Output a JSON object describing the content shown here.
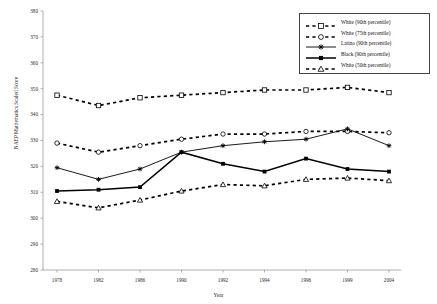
{
  "chart_data": {
    "type": "line",
    "title": "",
    "xlabel": "Year",
    "ylabel": "NAEP Mathematics Scaled Score",
    "x": [
      1978,
      1982,
      1986,
      1990,
      1992,
      1994,
      1996,
      1999,
      2004
    ],
    "xticklabels": [
      "1978",
      "1982",
      "1986",
      "1990",
      "1992",
      "1994",
      "1996",
      "1999",
      "2004"
    ],
    "yticks": [
      280,
      290,
      300,
      310,
      320,
      330,
      340,
      350,
      360,
      370,
      380
    ],
    "yticklabels": [
      "280",
      "290",
      "300",
      "310",
      "320",
      "330",
      "340",
      "350",
      "360",
      "370",
      "380"
    ],
    "ylim": [
      280,
      380
    ],
    "grid": false,
    "legend_position": "top-right",
    "series": [
      {
        "name": "White (90th percentile)",
        "marker": "square-open",
        "linestyle": "dashed",
        "color": "#000000",
        "values": [
          347.5,
          343.5,
          346.5,
          347.5,
          348.5,
          349.5,
          349.5,
          350.5,
          348.5
        ]
      },
      {
        "name": "White (75th percentile)",
        "marker": "circle-open",
        "linestyle": "dashed",
        "color": "#000000",
        "values": [
          329.0,
          325.5,
          328.0,
          330.5,
          332.5,
          332.5,
          333.5,
          333.5,
          333.0
        ]
      },
      {
        "name": "Latino (90th percentile)",
        "marker": "asterisk",
        "linestyle": "solid",
        "color": "#000000",
        "values": [
          319.5,
          315.0,
          319.0,
          325.5,
          328.0,
          329.5,
          330.5,
          334.5,
          328.0
        ]
      },
      {
        "name": "Black (90th percentile)",
        "marker": "square-filled",
        "linestyle": "solid-thick",
        "color": "#000000",
        "values": [
          310.5,
          311.0,
          312.0,
          325.5,
          321.0,
          318.0,
          323.0,
          319.0,
          318.0
        ]
      },
      {
        "name": "White (50th percentile)",
        "marker": "triangle-open",
        "linestyle": "dashed",
        "color": "#000000",
        "values": [
          306.5,
          304.0,
          307.0,
          310.5,
          313.0,
          312.5,
          315.0,
          315.5,
          314.5
        ]
      }
    ]
  },
  "legend": {
    "items": [
      {
        "label": "White (90th percentile)"
      },
      {
        "label": "White (75th percentile)"
      },
      {
        "label": "Latino (90th percentile)"
      },
      {
        "label": "Black (90th percentile)"
      },
      {
        "label": "White (50th percentile)"
      }
    ]
  },
  "axes": {
    "y_title": "NAEP Mathematics Scaled Score",
    "x_title": "Year"
  }
}
